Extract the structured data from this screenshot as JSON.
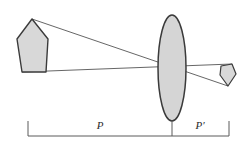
{
  "figure": {
    "background_color": "#ffffff",
    "stroke_color": "#3a3a3a",
    "ray_color": "#555555",
    "fill_color": "#d8d8d8",
    "scale_color": "#5a5a5a"
  },
  "labels": {
    "object_distance": "P",
    "image_distance": "P′"
  },
  "elements": {
    "object_name": "object-arrow",
    "lens_name": "converging-lens",
    "image_name": "image-arrow",
    "axis_name": "optical-axis",
    "scale_name": "distance-scale"
  },
  "chart_data": {
    "type": "diagram",
    "annotations": [
      "P",
      "P′"
    ],
    "object": {
      "label": "object-arrow",
      "shape": "pentagon-up",
      "points": "32,19 48,39 46,72 22,72 17,39",
      "apex": [
        32,
        19
      ],
      "base_left": [
        22,
        72
      ],
      "base_right": [
        46,
        72
      ]
    },
    "lens": {
      "label": "converging-lens",
      "shape": "ellipse",
      "center": [
        172,
        68
      ],
      "rx": 14,
      "ry": 53
    },
    "image": {
      "label": "image-arrow",
      "shape": "pentagon-down",
      "points": "228,86 220,75 221,66 232,64 236,74",
      "tip": [
        228,
        86
      ]
    },
    "rays": [
      {
        "name": "ray-apex-to-image-tip",
        "from": [
          32,
          19
        ],
        "to": [
          228,
          86
        ]
      },
      {
        "name": "ray-base-to-image-top",
        "from": [
          22,
          72
        ],
        "to": [
          232,
          64
        ]
      }
    ],
    "scale": {
      "label": "distance-scale",
      "baseline_y": 136,
      "tick_top_y": 121,
      "left_tick_x": 28,
      "mid_tick_x": 172,
      "right_tick_x": 229,
      "segments": [
        {
          "label": "P",
          "from_x": 28,
          "to_x": 172,
          "label_x": 100,
          "label_y": 129
        },
        {
          "label": "P′",
          "from_x": 172,
          "to_x": 229,
          "label_x": 200,
          "label_y": 129
        }
      ]
    }
  }
}
